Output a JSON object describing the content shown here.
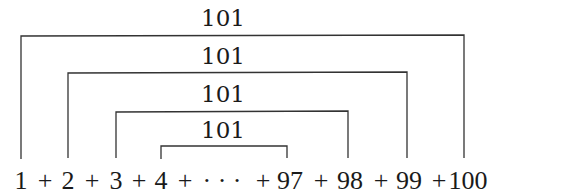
{
  "diagram": {
    "pairs": [
      {
        "left": "1",
        "right": "100",
        "sum": "101"
      },
      {
        "left": "2",
        "right": "99",
        "sum": "101"
      },
      {
        "left": "3",
        "right": "98",
        "sum": "101"
      },
      {
        "left": "4",
        "right": "97",
        "sum": "101"
      }
    ],
    "equation": {
      "terms": [
        "1",
        "2",
        "3",
        "4",
        "· · ·",
        "97",
        "98",
        "99",
        "100"
      ],
      "operator": "+",
      "text": "1 + 2 + 3 + 4 + · · · + 97 + 98 + 99 + 100"
    },
    "colors": {
      "stroke": "#333333",
      "text": "#1a1a1a",
      "background": "#ffffff"
    }
  }
}
